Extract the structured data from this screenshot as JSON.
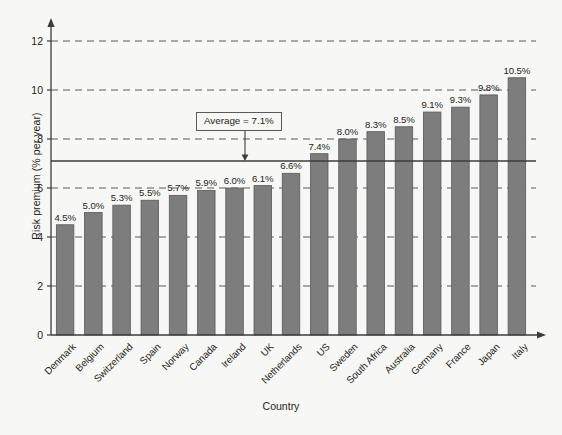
{
  "chart_data": {
    "type": "bar",
    "title": "",
    "xlabel": "Country",
    "ylabel": "Risk premium (% per year)",
    "ylim": [
      0,
      12
    ],
    "yticks": [
      0,
      2,
      4,
      6,
      8,
      10,
      12
    ],
    "grid": "horizontal-dashed",
    "legend": "none",
    "categories": [
      "Denmark",
      "Belgium",
      "Switzerland",
      "Spain",
      "Norway",
      "Canada",
      "Ireland",
      "UK",
      "Netherlands",
      "US",
      "Sweden",
      "South Africa",
      "Australia",
      "Germany",
      "France",
      "Japan",
      "Italy"
    ],
    "values": [
      4.5,
      5.0,
      5.3,
      5.5,
      5.7,
      5.9,
      6.0,
      6.1,
      6.6,
      7.4,
      8.0,
      8.3,
      8.5,
      9.1,
      9.3,
      9.8,
      10.5
    ],
    "value_labels": [
      "4.5%",
      "5.0%",
      "5.3%",
      "5.5%",
      "5.7%",
      "5.9%",
      "6.0%",
      "6.1%",
      "6.6%",
      "7.4%",
      "8.0%",
      "8.3%",
      "8.5%",
      "9.1%",
      "9.3%",
      "9.8%",
      "10.5%"
    ],
    "annotations": [
      {
        "label": "Average = 7.1%",
        "value": 7.1,
        "type": "reference-line-with-arrow"
      }
    ],
    "bar_color": "#7d7d7d",
    "bar_edge_color": "#58595b",
    "background_color": "#f7f7f5",
    "axis_color": "#3c3c3c",
    "grid_color": "#58595b"
  },
  "axes": {
    "y_title": "Risk premium (% per year)",
    "x_title": "Country",
    "y_tick_labels": [
      "0",
      "2",
      "4",
      "6",
      "8",
      "10",
      "12"
    ]
  },
  "annotation": {
    "average_label": "Average = 7.1%"
  }
}
